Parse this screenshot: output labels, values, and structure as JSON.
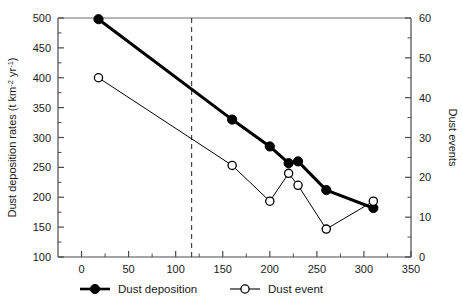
{
  "chart_data": {
    "type": "line",
    "title": "",
    "xlabel": "",
    "ylabel": "Dust deposition rates (t km",
    "ylabel_sup1": "-2",
    "ylabel_mid": " yr",
    "ylabel_sup2": "-1",
    "ylabel_end": ")",
    "y2label": "Dust events",
    "xlim": [
      -25,
      350
    ],
    "ylim": [
      100,
      500
    ],
    "y2lim": [
      0,
      60
    ],
    "xticks": [
      0,
      50,
      100,
      150,
      200,
      250,
      300,
      350
    ],
    "xtick_labels": [
      "0",
      "50",
      "100",
      "150",
      "200",
      "250",
      "300",
      "350"
    ],
    "xminor_step": 25,
    "yticks": [
      100,
      150,
      200,
      250,
      300,
      350,
      400,
      450,
      500
    ],
    "ytick_labels": [
      "100",
      "150",
      "200",
      "250",
      "300",
      "350",
      "400",
      "450",
      "500"
    ],
    "yminor_step": 25,
    "y2ticks": [
      0,
      10,
      20,
      30,
      40,
      50,
      60
    ],
    "y2tick_labels": [
      "0",
      "10",
      "20",
      "30",
      "40",
      "50",
      "60"
    ],
    "y2minor_step": 5,
    "grid": false,
    "legend_position": "below-axes",
    "annotations": [
      {
        "type": "vline",
        "x": 117,
        "style": "dashed",
        "label": ""
      }
    ],
    "series": [
      {
        "name": "Dust deposition",
        "axis": "left",
        "marker": "filled-circle",
        "color": "#000000",
        "linewidth": 3,
        "x": [
          18,
          160,
          200,
          220,
          230,
          260,
          310
        ],
        "values": [
          498,
          330,
          285,
          257,
          260,
          212,
          182
        ]
      },
      {
        "name": "Dust event",
        "axis": "right",
        "marker": "open-circle",
        "color": "#000000",
        "linewidth": 1,
        "x": [
          18,
          160,
          200,
          220,
          230,
          260,
          310
        ],
        "values": [
          45,
          23,
          14,
          21,
          18,
          7,
          14
        ]
      }
    ]
  },
  "legend": {
    "items": [
      {
        "label": "Dust deposition",
        "marker": "filled-circle"
      },
      {
        "label": "Dust event",
        "marker": "open-circle"
      }
    ]
  }
}
